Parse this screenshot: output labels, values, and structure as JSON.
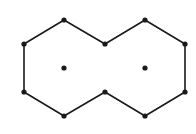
{
  "diagram": {
    "type": "two fused hexagons (naphthalene-like outline) with center points",
    "stroke_color": "#1a1a1a",
    "background": "#ffffff",
    "outline_vertices": [
      [
        64,
        20
      ],
      [
        105,
        44
      ],
      [
        145,
        20
      ],
      [
        185,
        44
      ],
      [
        185,
        92
      ],
      [
        145,
        116
      ],
      [
        105,
        92
      ],
      [
        64,
        116
      ],
      [
        24,
        92
      ],
      [
        24,
        44
      ]
    ],
    "center_points": [
      [
        64,
        68
      ],
      [
        145,
        68
      ]
    ]
  }
}
